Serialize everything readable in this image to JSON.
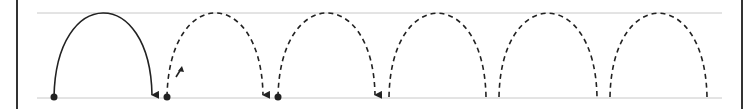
{
  "diagram": {
    "colors": {
      "background": "#ffffff",
      "guide_line": "#c8c8c8",
      "border": "#333333",
      "stroke": "#222222"
    },
    "frame": {
      "left_x": 17,
      "right_x": 742
    },
    "guides": {
      "top_y": 13,
      "bottom_y": 98,
      "x_start": 37,
      "x_end": 722
    },
    "arcs": [
      {
        "x1": 54,
        "x2": 152,
        "style": "solid",
        "start_dot": true,
        "end_arrow": true
      },
      {
        "x1": 167,
        "x2": 263,
        "style": "dashed",
        "start_dot": true,
        "end_arrow": true
      },
      {
        "x1": 278,
        "x2": 375,
        "style": "dashed",
        "start_dot": true,
        "end_arrow": true
      },
      {
        "x1": 389,
        "x2": 486,
        "style": "dashed",
        "start_dot": false,
        "end_arrow": false
      },
      {
        "x1": 499,
        "x2": 597,
        "style": "dashed",
        "start_dot": false,
        "end_arrow": false
      },
      {
        "x1": 610,
        "x2": 707,
        "style": "dashed",
        "start_dot": false,
        "end_arrow": false
      }
    ],
    "direction_hint": {
      "icon": "small-up-arrow-icon",
      "x1": 176,
      "y1": 77,
      "x2": 181,
      "y2": 66
    }
  }
}
